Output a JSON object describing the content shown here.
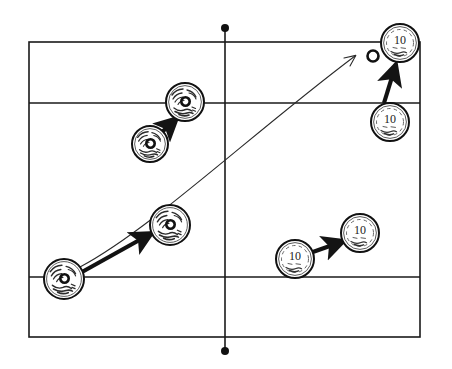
{
  "figure": {
    "title": "",
    "background_color": "#ffffff",
    "ink_color": "#1a1a1a"
  },
  "board": {
    "name": "playing-field",
    "outer_rect": {
      "x": 29,
      "y": 42,
      "width": 391,
      "height": 295
    },
    "horizontal_lines": [
      {
        "name": "upper-division-line",
        "y": 103
      },
      {
        "name": "lower-division-line",
        "y": 277
      }
    ],
    "center_axis": {
      "name": "vertical-center-axis",
      "x": 225,
      "y_top": 28,
      "y_bottom": 351,
      "end_marker": "filled-dot",
      "marker_radius": 4
    }
  },
  "tokens": [
    {
      "id": "token-a1",
      "name": "textured-token-lower-left",
      "label": "",
      "style": "textured",
      "cx": 64,
      "cy": 279,
      "r": 20
    },
    {
      "id": "token-a2",
      "name": "textured-token-mid-left",
      "label": "",
      "style": "textured",
      "cx": 170,
      "cy": 225,
      "r": 20
    },
    {
      "id": "token-b1",
      "name": "textured-token-upper-left-lower",
      "label": "",
      "style": "textured",
      "cx": 150,
      "cy": 144,
      "r": 18
    },
    {
      "id": "token-b2",
      "name": "textured-token-upper-left-upper",
      "label": "",
      "style": "textured",
      "cx": 185,
      "cy": 102,
      "r": 19
    },
    {
      "id": "token-c1",
      "name": "numbered-token-bottom-right-left",
      "label": "10",
      "style": "numbered",
      "cx": 295,
      "cy": 259,
      "r": 19
    },
    {
      "id": "token-c2",
      "name": "numbered-token-bottom-right-right",
      "label": "10",
      "style": "numbered",
      "cx": 360,
      "cy": 233,
      "r": 19
    },
    {
      "id": "token-d1",
      "name": "numbered-token-top-right-lower",
      "label": "10",
      "style": "numbered",
      "cx": 390,
      "cy": 122,
      "r": 19
    },
    {
      "id": "token-d2",
      "name": "numbered-token-top-right-upper",
      "label": "10",
      "style": "numbered",
      "cx": 400,
      "cy": 43,
      "r": 19
    }
  ],
  "arrows": [
    {
      "id": "arrow-1",
      "name": "thick-arrow-lower-left-to-mid-left",
      "kind": "thick-straight",
      "from": "token-a1",
      "to": "token-a2",
      "x1": 82,
      "y1": 272,
      "x2": 152,
      "y2": 233
    },
    {
      "id": "arrow-2",
      "name": "thick-arrow-upper-left-pair",
      "kind": "thick-straight",
      "from": "token-b1",
      "to": "token-b2",
      "x1": 161,
      "y1": 133,
      "x2": 177,
      "y2": 118
    },
    {
      "id": "arrow-3",
      "name": "thick-arrow-bottom-right-pair",
      "kind": "thick-straight",
      "from": "token-c1",
      "to": "token-c2",
      "x1": 310,
      "y1": 253,
      "x2": 344,
      "y2": 241
    },
    {
      "id": "arrow-4",
      "name": "thick-arrow-top-right-pair",
      "kind": "thick-straight",
      "from": "token-d1",
      "to": "token-d2",
      "x1": 384,
      "y1": 103,
      "x2": 396,
      "y2": 64
    },
    {
      "id": "arrow-5",
      "name": "thin-curved-trajectory-arrow",
      "kind": "thin-curved",
      "from": "token-a1",
      "to": "open-ring-target",
      "path": "M 80 267 C 150 230, 250 135, 355 56",
      "head_x": 358,
      "head_y": 54
    }
  ],
  "target_ring": {
    "name": "open-ring-target",
    "cx": 373,
    "cy": 56,
    "r_outer": 5.5,
    "r_inner": 2.6
  }
}
